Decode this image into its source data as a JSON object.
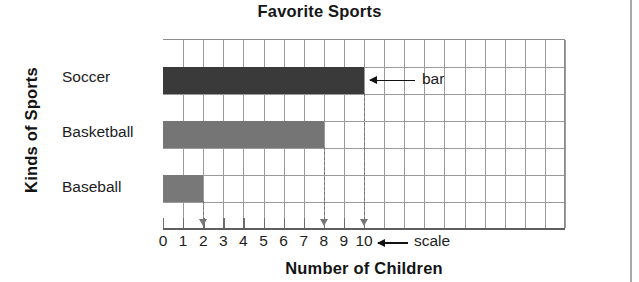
{
  "chart_data": {
    "type": "bar",
    "orientation": "horizontal",
    "title": "Favorite Sports",
    "xlabel": "Number of Children",
    "ylabel": "Kinds of Sports",
    "categories": [
      "Soccer",
      "Basketball",
      "Baseball"
    ],
    "values": [
      10,
      8,
      2
    ],
    "series": [
      {
        "name": "Number of Children",
        "values": [
          10,
          8,
          2
        ]
      }
    ],
    "xlim": [
      0,
      10
    ],
    "xticks": [
      0,
      1,
      2,
      3,
      4,
      5,
      6,
      7,
      8,
      9,
      10
    ],
    "xtick_labels": [
      "0",
      "1",
      "2",
      "3",
      "4",
      "5",
      "6",
      "7",
      "8",
      "9",
      "10"
    ],
    "grid": true,
    "legend": "none",
    "bar_colors": [
      "#3a3a3a",
      "#757575",
      "#787878"
    ],
    "grid_color": "#9a9a9a",
    "axis_color": "#5e5e5e",
    "guide_color": "#777777",
    "annotations": [
      {
        "label": "bar",
        "points_to": "Soccer bar end at 10"
      },
      {
        "label": "scale",
        "points_to": "x-axis tick label 10"
      }
    ]
  },
  "annotations": {
    "bar_label": "bar",
    "scale_label": "scale"
  }
}
